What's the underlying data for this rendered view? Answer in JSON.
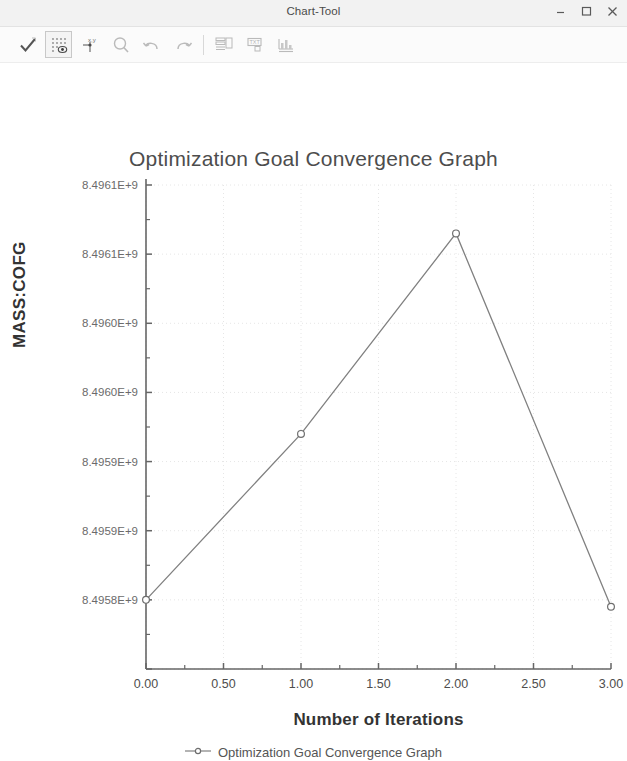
{
  "window": {
    "title": "Chart-Tool",
    "controls": [
      {
        "name": "minimize-button",
        "glyph": "minimize"
      },
      {
        "name": "maximize-button",
        "glyph": "maximize"
      },
      {
        "name": "close-button",
        "glyph": "close"
      }
    ]
  },
  "toolbar": {
    "buttons": [
      {
        "name": "apply-check-button",
        "icon": "checkmark-icon",
        "state": "normal"
      },
      {
        "name": "grid-display-button",
        "icon": "grid-dots-icon",
        "state": "selected"
      },
      {
        "name": "axes-xy-button",
        "icon": "xy-axes-icon",
        "state": "normal"
      },
      {
        "name": "zoom-button",
        "icon": "magnifier-icon",
        "state": "faded"
      },
      {
        "name": "undo-button",
        "icon": "undo-arrow-icon",
        "state": "faded"
      },
      {
        "name": "redo-button",
        "icon": "redo-arrow-icon",
        "state": "faded"
      },
      {
        "name": "table-layout-button",
        "icon": "table-icon",
        "state": "faded"
      },
      {
        "name": "text-annotation-button",
        "icon": "text-box-icon",
        "state": "faded"
      },
      {
        "name": "export-chart-button",
        "icon": "export-chart-icon",
        "state": "faded"
      }
    ]
  },
  "chart_data": {
    "type": "line",
    "title": "Optimization Goal Convergence Graph",
    "xlabel": "Number of Iterations",
    "ylabel": "MASS:COFG",
    "x": [
      0,
      1,
      2,
      3
    ],
    "values": [
      8495850000.0,
      8495970000.0,
      8496115000.0,
      8495845000.0
    ],
    "series": [
      {
        "name": "Optimization Goal Convergence Graph",
        "x": [
          0,
          1,
          2,
          3
        ],
        "values": [
          8495850000.0,
          8495970000.0,
          8496115000.0,
          8495845000.0
        ]
      }
    ],
    "xlim": [
      0,
      3
    ],
    "ylim": [
      8495800000.0,
      8496150000.0
    ],
    "xticks": [
      0,
      0.5,
      1,
      1.5,
      2,
      2.5,
      3
    ],
    "xticklabels": [
      "0.00",
      "0.50",
      "1.00",
      "1.50",
      "2.00",
      "2.50",
      "3.00"
    ],
    "yticks": [
      8495800000.0,
      8495850000.0,
      8495900000.0,
      8495950000.0,
      8496000000.0,
      8496050000.0,
      8496100000.0,
      8496150000.0
    ],
    "yticklabels_shown": [
      "8.4961E+9",
      "8.4961E+9",
      "8.4960E+9",
      "8.4960E+9",
      "8.4959E+9",
      "8.4959E+9",
      "8.4958E+9"
    ],
    "grid": true,
    "grid_style": "dotted",
    "marker": "open-circle",
    "line_color": "#808080",
    "grid_color": "#e6e6e6",
    "axis_color": "#666666",
    "legend": {
      "position": "bottom",
      "entries": [
        {
          "label": "Optimization Goal Convergence Graph",
          "marker": "open-circle",
          "color": "#808080"
        }
      ]
    }
  }
}
